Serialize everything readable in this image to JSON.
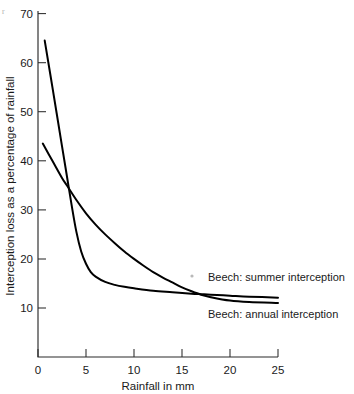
{
  "chart_data": {
    "type": "line",
    "title": "",
    "subtitle": "",
    "xlabel": "Rainfall in mm",
    "ylabel": "Interception loss as a percentage of rainfall",
    "xlim": [
      0,
      25
    ],
    "ylim": [
      0,
      70
    ],
    "xticks": [
      0,
      5,
      10,
      15,
      20,
      25
    ],
    "yticks": [
      10,
      20,
      30,
      40,
      50,
      60,
      70
    ],
    "xtick_labels": [
      "0",
      "5",
      "10",
      "15",
      "20",
      "25"
    ],
    "ytick_labels": [
      "10",
      "20",
      "30",
      "40",
      "50",
      "60",
      "70"
    ],
    "grid": false,
    "legend_position": "inline-right",
    "series": [
      {
        "name": "Beech: summer interception",
        "label": "Beech: summer interception",
        "color": "#000000",
        "x": [
          0.7,
          1.5,
          2.5,
          3.0,
          3.5,
          4.0,
          4.5,
          5.0,
          5.5,
          6.0,
          7.0,
          8.0,
          9.0,
          10.0,
          12.0,
          14.0,
          16.0,
          17.0,
          18.0,
          20.0,
          22.0,
          25.0
        ],
        "y": [
          64.5,
          55.0,
          43.0,
          37.0,
          31.0,
          25.5,
          21.5,
          19.0,
          17.3,
          16.4,
          15.3,
          14.7,
          14.3,
          14.0,
          13.5,
          13.2,
          12.9,
          12.8,
          12.7,
          12.5,
          12.3,
          12.1
        ]
      },
      {
        "name": "Beech: annual interception",
        "label": "Beech: annual interception",
        "color": "#000000",
        "x": [
          0.5,
          1.5,
          2.5,
          3.0,
          4.0,
          5.0,
          6.0,
          7.0,
          8.0,
          9.0,
          10.0,
          11.0,
          12.0,
          13.0,
          14.0,
          15.0,
          16.0,
          17.0,
          18.0,
          20.0,
          22.0,
          25.0
        ],
        "y": [
          43.5,
          40.0,
          36.5,
          35.0,
          32.0,
          29.3,
          27.0,
          25.0,
          23.2,
          21.5,
          20.0,
          18.6,
          17.3,
          16.2,
          15.2,
          14.2,
          13.4,
          12.7,
          12.2,
          11.5,
          11.2,
          11.0
        ]
      }
    ],
    "annotations": [
      {
        "name": "summer-series-label",
        "text": "Beech: summer interception",
        "x_px": 208,
        "y_px": 281
      },
      {
        "name": "annual-series-label",
        "text": "Beech: annual interception",
        "x_px": 208,
        "y_px": 318
      }
    ],
    "artifacts": {
      "corner_mark": "r",
      "speck": "dot"
    }
  },
  "axes": {
    "x_axis_name": "Rainfall in mm",
    "y_axis_name": "Interception loss as a percentage of rainfall"
  }
}
